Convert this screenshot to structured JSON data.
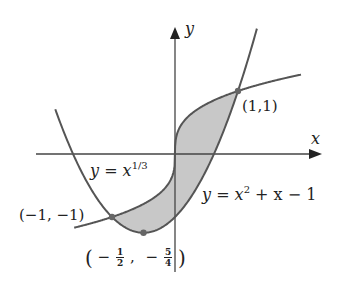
{
  "diagram": {
    "axes": {
      "x_label": "x",
      "y_label": "y",
      "origin_px": [
        175,
        154
      ],
      "scale_px_per_unit": [
        63,
        63
      ]
    },
    "curves": [
      {
        "name": "cube-root",
        "equation": "y = x^(1/3)",
        "label_base": "y = x",
        "label_exp": "1/3",
        "x_range": [
          -1.6,
          2.0
        ]
      },
      {
        "name": "parabola",
        "equation": "y = x^2 + x - 1",
        "label_text": "y = x",
        "label_exp": "2",
        "label_tail": " + x − 1",
        "x_range": [
          -1.9,
          1.3
        ]
      }
    ],
    "shaded_region": {
      "between": [
        "y = x^(1/3)",
        "y = x^2 + x - 1"
      ],
      "x_from": -1,
      "x_to": 1,
      "fill": "#c8c8c8"
    },
    "points": [
      {
        "label": "(1,1)",
        "x": 1,
        "y": 1
      },
      {
        "label": "(−1, −1)",
        "x": -1,
        "y": -1
      },
      {
        "label_open": "(",
        "sign1": "−",
        "frac1_num": "1",
        "frac1_den": "2",
        "sep": ",",
        "sign2": "−",
        "frac2_num": "5",
        "frac2_den": "4",
        "label_close": ")",
        "x": -0.5,
        "y": -1.25
      }
    ],
    "colors": {
      "curve": "#555555",
      "axis": "#444444",
      "shade": "#c8c8c8",
      "point": "#666666"
    }
  }
}
